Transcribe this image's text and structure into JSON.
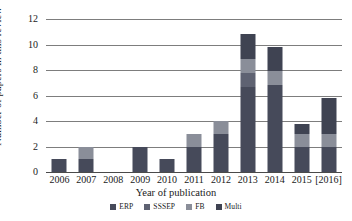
{
  "chart_data": {
    "type": "bar",
    "subtype": "stacked-bar",
    "title": "",
    "xlabel": "Year of publication",
    "ylabel": "Number of papers in this review",
    "categories": [
      "2006",
      "2007",
      "2008",
      "2009",
      "2010",
      "2011",
      "2012",
      "2013",
      "2014",
      "2015",
      "[2016]"
    ],
    "ylim": [
      0,
      12
    ],
    "yticks": [
      0,
      2,
      4,
      6,
      8,
      10,
      12
    ],
    "grid": true,
    "legend_position": "bottom",
    "series": [
      {
        "name": "ERP",
        "color": "#464a5a",
        "values": [
          1,
          1,
          0,
          2,
          1,
          2,
          3,
          6.7,
          6.8,
          2,
          2
        ]
      },
      {
        "name": "SSSEP",
        "color": "#5e6272",
        "values": [
          0,
          0,
          0,
          0,
          0,
          0,
          0,
          1.1,
          0,
          0,
          0
        ]
      },
      {
        "name": "FB",
        "color": "#8a8e99",
        "values": [
          0,
          1,
          0,
          0,
          0,
          1,
          1,
          1.1,
          1.1,
          1,
          1
        ]
      },
      {
        "name": "Multi",
        "color": "#3f4352",
        "values": [
          0,
          0,
          0,
          0,
          0,
          0,
          0,
          1.9,
          1.9,
          0.8,
          2.8
        ]
      }
    ],
    "totals": [
      1,
      2,
      0,
      2,
      1,
      3,
      4,
      10.8,
      9.8,
      3.8,
      5.8
    ]
  },
  "legend": {
    "items": [
      {
        "label": "ERP",
        "color": "#464a5a"
      },
      {
        "label": "SSSEP",
        "color": "#5e6272"
      },
      {
        "label": "FB",
        "color": "#8a8e99"
      },
      {
        "label": "Multi",
        "color": "#3f4352"
      }
    ]
  },
  "axes": {
    "y_tick_labels": [
      "0",
      "2",
      "4",
      "6",
      "8",
      "10",
      "12"
    ],
    "x_tick_labels": [
      "2006",
      "2007",
      "2008",
      "2009",
      "2010",
      "2011",
      "2012",
      "2013",
      "2014",
      "2015",
      "[2016]"
    ],
    "x_title": "Year of publication",
    "y_title": "Number of papers in this review"
  },
  "colors": {
    "gridline": "#7d7d7d",
    "background": "#ffffff",
    "text": "#1a1a1a"
  }
}
